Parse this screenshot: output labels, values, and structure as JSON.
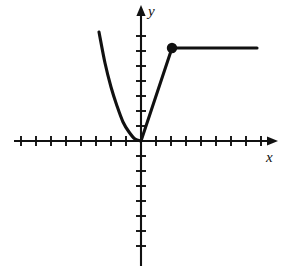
{
  "figure": {
    "label": ")",
    "background_color": "#ffffff",
    "stroke_color": "#111111",
    "width": 293,
    "height": 266
  },
  "axes": {
    "x_label": "x",
    "y_label": "y",
    "origin": {
      "x": 141,
      "y": 141
    },
    "x_axis": {
      "start_x": 14,
      "end_x": 278,
      "y": 141,
      "arrow": "right"
    },
    "y_axis": {
      "x": 141,
      "start_y": 5,
      "end_y": 266,
      "arrow": "up"
    },
    "tick_spacing": 15,
    "tick_half_length": 5,
    "ticks_left": 8,
    "ticks_right": 8,
    "ticks_up": 7,
    "ticks_down": 7
  },
  "chart_data": {
    "type": "line",
    "title": "",
    "xlabel": "x",
    "ylabel": "y",
    "grid": false,
    "legend": "none",
    "xlim": [
      -8.5,
      9.2
    ],
    "ylim": [
      -8.5,
      9.2
    ],
    "annotations": [
      {
        "kind": "closed-endpoint",
        "marker": "filled-circle",
        "x": 2,
        "y": 6.2,
        "pixel": {
          "x": 172,
          "y": 48
        },
        "radius_px": 4.2
      }
    ],
    "series": [
      {
        "name": "left-parabolic-branch",
        "kind": "curve",
        "domain": [
          -2.8,
          0
        ],
        "points": [
          {
            "x": -2.8,
            "y": 7.3
          },
          {
            "x": -2.4,
            "y": 5.2
          },
          {
            "x": -2.0,
            "y": 3.6
          },
          {
            "x": -1.6,
            "y": 2.3
          },
          {
            "x": -1.2,
            "y": 1.3
          },
          {
            "x": -0.8,
            "y": 0.6
          },
          {
            "x": -0.4,
            "y": 0.15
          },
          {
            "x": 0.0,
            "y": 0.0
          }
        ],
        "pixel_points": [
          {
            "x": 99,
            "y": 32
          },
          {
            "x": 105,
            "y": 63
          },
          {
            "x": 111,
            "y": 87
          },
          {
            "x": 117,
            "y": 106
          },
          {
            "x": 123,
            "y": 122
          },
          {
            "x": 129,
            "y": 132
          },
          {
            "x": 135,
            "y": 139
          },
          {
            "x": 141,
            "y": 141
          }
        ]
      },
      {
        "name": "rising-segment",
        "kind": "segment",
        "domain": [
          0,
          2
        ],
        "points": [
          {
            "x": 0,
            "y": 0
          },
          {
            "x": 2,
            "y": 6.2
          }
        ],
        "pixel_points": [
          {
            "x": 141,
            "y": 141
          },
          {
            "x": 172,
            "y": 48
          }
        ]
      },
      {
        "name": "horizontal-ray",
        "kind": "segment",
        "domain": [
          2,
          7.7
        ],
        "points": [
          {
            "x": 2,
            "y": 6.2
          },
          {
            "x": 7.7,
            "y": 6.2
          }
        ],
        "pixel_points": [
          {
            "x": 172,
            "y": 48
          },
          {
            "x": 257,
            "y": 48
          }
        ]
      }
    ]
  }
}
